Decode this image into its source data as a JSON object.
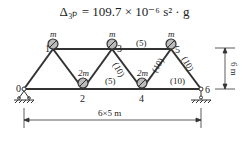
{
  "formula": {
    "text": "Δ₃ₚ = 109.7 × 10⁻⁶ s² · g"
  },
  "truss": {
    "nodes": [
      {
        "id": "0",
        "label": "0",
        "x": 24,
        "y": 89
      },
      {
        "id": "1",
        "label": "1",
        "x": 53,
        "y": 49,
        "mass": "m"
      },
      {
        "id": "2",
        "label": "2",
        "x": 83,
        "y": 89,
        "mass": "2m"
      },
      {
        "id": "3",
        "label": "3",
        "x": 112,
        "y": 49,
        "mass": "m"
      },
      {
        "id": "4",
        "label": "4",
        "x": 142,
        "y": 89,
        "mass": "2m"
      },
      {
        "id": "5",
        "label": "5",
        "x": 171,
        "y": 49,
        "mass": "m"
      },
      {
        "id": "6",
        "label": "6",
        "x": 201,
        "y": 89
      }
    ],
    "member_labels": [
      {
        "text": "(5)",
        "x": 141,
        "y": 44
      },
      {
        "text": "(10)",
        "x": 120,
        "y": 68,
        "rotate": 60
      },
      {
        "text": "(5)",
        "x": 110,
        "y": 82
      },
      {
        "text": "(10)",
        "x": 162,
        "y": 67,
        "rotate": -60
      },
      {
        "text": "(10)",
        "x": 178,
        "y": 82
      },
      {
        "text": "(10)",
        "x": 191,
        "y": 66,
        "rotate": 60
      }
    ]
  },
  "dimensions": {
    "height_label": "6 m",
    "span_label": "6×5 m"
  }
}
